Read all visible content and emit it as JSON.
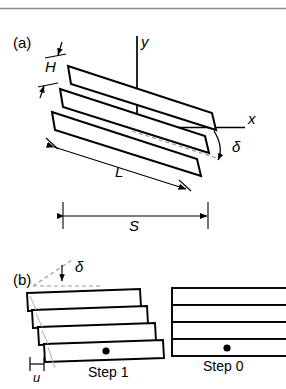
{
  "figure": {
    "type": "schematic-diagram",
    "background_color": "#ffffff",
    "stroke_color": "#000000",
    "rule_color": "#8a8a8a",
    "dashed_color": "#9a9a9a",
    "top_rule": {
      "name": "horizontal-rule",
      "y": 8
    }
  },
  "panel_a": {
    "id": "(a)",
    "description": "Three parallel plates inclined by angle delta, with x-y axes at origin",
    "plate_count": 3,
    "labels": {
      "thickness": "H",
      "length": "L",
      "span": "S",
      "angle": "δ",
      "axis_x": "x",
      "axis_y": "y"
    },
    "annotations": [
      {
        "name": "thickness-dimension",
        "symbol": "H",
        "kind": "double-arrow-vertical"
      },
      {
        "name": "length-dimension",
        "symbol": "L",
        "kind": "double-arrow-inclined"
      },
      {
        "name": "span-dimension",
        "symbol": "S",
        "kind": "double-arrow-horizontal"
      },
      {
        "name": "angle-dimension",
        "symbol": "δ",
        "kind": "arc-arrow"
      }
    ]
  },
  "panel_b": {
    "id": "(b)",
    "description": "Comparison of a sheared stack (Step 1) and an aligned stack (Step 0)",
    "labels": {
      "angle": "δ",
      "offset": "u",
      "step_one": "Step 1",
      "step_zero": "Step 0"
    },
    "stacks": [
      {
        "name": "step-1-stack",
        "label": "Step 1",
        "plate_count": 4,
        "sheared": true,
        "marker": "dot"
      },
      {
        "name": "step-0-stack",
        "label": "Step 0",
        "plate_count": 4,
        "sheared": false,
        "marker": "dot"
      }
    ],
    "annotations": [
      {
        "name": "angle-dimension",
        "symbol": "δ",
        "kind": "arrow-to-dashed-baseline"
      },
      {
        "name": "offset-dimension",
        "symbol": "u",
        "kind": "horizontal-extent-ticks"
      }
    ]
  }
}
